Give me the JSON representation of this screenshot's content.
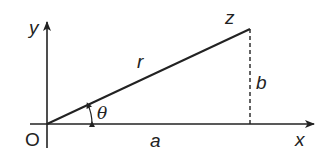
{
  "diagram": {
    "type": "complex-plane-polar",
    "labels": {
      "origin": "O",
      "x_axis": "x",
      "y_axis": "y",
      "point": "z",
      "modulus": "r",
      "angle": "θ",
      "real_part": "a",
      "imag_part": "b"
    },
    "colors": {
      "stroke": "#222222",
      "background": "#ffffff"
    }
  }
}
